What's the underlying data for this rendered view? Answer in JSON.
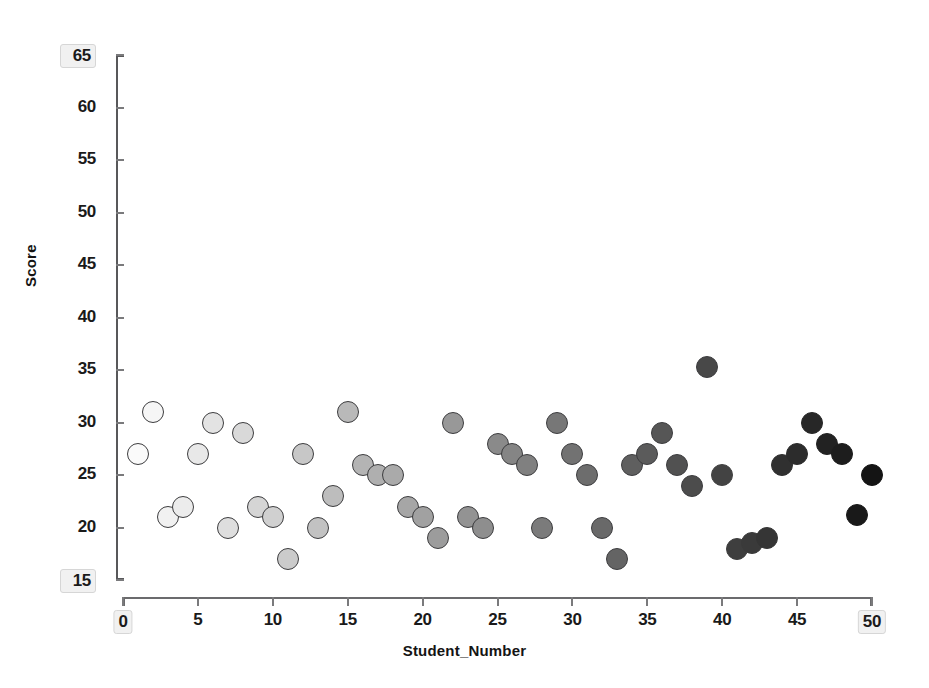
{
  "chart_data": {
    "type": "scatter",
    "title": "",
    "xlabel": "Student_Number",
    "ylabel": "Score",
    "xlim": [
      0,
      50
    ],
    "ylim": [
      15,
      65
    ],
    "grid": false,
    "legend": null,
    "xticks": [
      0,
      5,
      10,
      15,
      20,
      25,
      30,
      35,
      40,
      45,
      50
    ],
    "xtick_labels": [
      "0",
      "5",
      "10",
      "15",
      "20",
      "25",
      "30",
      "35",
      "40",
      "45",
      "50"
    ],
    "yticks": [
      15,
      20,
      25,
      30,
      35,
      40,
      45,
      50,
      55,
      60,
      65
    ],
    "ytick_labels": [
      "15",
      "20",
      "25",
      "30",
      "35",
      "40",
      "45",
      "50",
      "55",
      "60",
      "65"
    ],
    "x_endpoint_labels": [
      "0",
      "50"
    ],
    "y_endpoint_labels": [
      "15",
      "65"
    ],
    "marker": {
      "shape": "circle",
      "size_px": 22,
      "edge_color": "#3d3d3f",
      "colormap": "greys-light-to-dark",
      "color_scale_by": "x",
      "fill_start": "#ffffff",
      "fill_end": "#1a1a1a"
    },
    "x": [
      1,
      2,
      3,
      4,
      5,
      6,
      7,
      8,
      9,
      10,
      11,
      12,
      13,
      14,
      15,
      16,
      17,
      18,
      19,
      20,
      21,
      22,
      23,
      24,
      25,
      26,
      27,
      28,
      29,
      30,
      31,
      32,
      33,
      34,
      35,
      36,
      37,
      38,
      39,
      40,
      41,
      42,
      43,
      44,
      45,
      46,
      47,
      48,
      49,
      50
    ],
    "y": [
      27,
      31,
      21,
      22,
      27,
      30,
      20,
      29,
      22,
      21,
      17,
      27,
      20,
      23,
      31,
      26,
      25,
      25,
      22,
      21,
      19,
      30,
      21,
      20,
      28,
      27,
      26,
      20,
      30,
      27,
      25,
      20,
      17,
      26,
      27,
      29,
      26,
      24,
      35.3,
      25,
      18,
      18.5,
      19,
      26,
      27,
      30,
      28,
      27,
      21.2,
      25
    ],
    "series": [
      {
        "name": "Score",
        "points": [
          {
            "x": 1,
            "y": 27
          },
          {
            "x": 2,
            "y": 31
          },
          {
            "x": 3,
            "y": 21
          },
          {
            "x": 4,
            "y": 22
          },
          {
            "x": 5,
            "y": 27
          },
          {
            "x": 6,
            "y": 30
          },
          {
            "x": 7,
            "y": 20
          },
          {
            "x": 8,
            "y": 29
          },
          {
            "x": 9,
            "y": 22
          },
          {
            "x": 10,
            "y": 21
          },
          {
            "x": 11,
            "y": 17
          },
          {
            "x": 12,
            "y": 27
          },
          {
            "x": 13,
            "y": 20
          },
          {
            "x": 14,
            "y": 23
          },
          {
            "x": 15,
            "y": 31
          },
          {
            "x": 16,
            "y": 26
          },
          {
            "x": 17,
            "y": 25
          },
          {
            "x": 18,
            "y": 25
          },
          {
            "x": 19,
            "y": 22
          },
          {
            "x": 20,
            "y": 21
          },
          {
            "x": 21,
            "y": 19
          },
          {
            "x": 22,
            "y": 30
          },
          {
            "x": 23,
            "y": 21
          },
          {
            "x": 24,
            "y": 20
          },
          {
            "x": 25,
            "y": 28
          },
          {
            "x": 26,
            "y": 27
          },
          {
            "x": 27,
            "y": 26
          },
          {
            "x": 28,
            "y": 20
          },
          {
            "x": 29,
            "y": 30
          },
          {
            "x": 30,
            "y": 27
          },
          {
            "x": 31,
            "y": 25
          },
          {
            "x": 32,
            "y": 20
          },
          {
            "x": 33,
            "y": 17
          },
          {
            "x": 34,
            "y": 26
          },
          {
            "x": 35,
            "y": 27
          },
          {
            "x": 36,
            "y": 29
          },
          {
            "x": 37,
            "y": 26
          },
          {
            "x": 38,
            "y": 24
          },
          {
            "x": 39,
            "y": 35.3
          },
          {
            "x": 40,
            "y": 25
          },
          {
            "x": 41,
            "y": 18
          },
          {
            "x": 42,
            "y": 18.5
          },
          {
            "x": 43,
            "y": 19
          },
          {
            "x": 44,
            "y": 26
          },
          {
            "x": 45,
            "y": 27
          },
          {
            "x": 46,
            "y": 30
          },
          {
            "x": 47,
            "y": 28
          },
          {
            "x": 48,
            "y": 27
          },
          {
            "x": 49,
            "y": 21.2
          },
          {
            "x": 50,
            "y": 25
          }
        ]
      }
    ]
  }
}
